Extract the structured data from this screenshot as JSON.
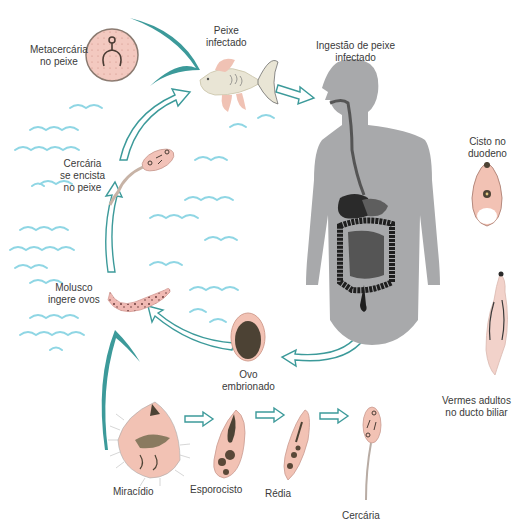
{
  "diagram": {
    "type": "life-cycle",
    "colors": {
      "arrow_teal": "#3c9a9a",
      "water_waves": "#8fd6e4",
      "organism_pink": "#f2c7bd",
      "organism_outline": "#b99a8f",
      "organ_dark": "#2a2a2a",
      "body_gray": "#a8a9ab",
      "egg_brown": "#4c4234"
    },
    "labels": {
      "metacercaria": [
        "Metacercária",
        "no peixe"
      ],
      "infected_fish": [
        "Peixe",
        "infectado"
      ],
      "ingestion": [
        "Ingestão de peixe",
        "infectado"
      ],
      "cyst_duodenum": [
        "Cisto no",
        "duodeno"
      ],
      "cercaria_encysts": [
        "Cercária",
        "se encista",
        "no peixe"
      ],
      "mollusk_eggs": [
        "Molusco",
        "ingere ovos"
      ],
      "embryonated_egg": [
        "Ovo",
        "embrionado"
      ],
      "adult_worms": [
        "Vermes adultos",
        "no ducto biliar"
      ],
      "miracidium": "Miracídio",
      "sporocyst": "Esporocisto",
      "redia": "Rédia",
      "cercaria": "Cercária"
    },
    "stages": [
      {
        "id": "miracidium",
        "label": "Miracídio"
      },
      {
        "id": "sporocyst",
        "label": "Esporocisto"
      },
      {
        "id": "redia",
        "label": "Rédia"
      },
      {
        "id": "cercaria",
        "label": "Cercária"
      }
    ],
    "cycle_order": [
      "Ovo embrionado",
      "Molusco ingere ovos",
      "Cercária se encista no peixe",
      "Peixe infectado",
      "Ingestão de peixe infectado",
      "Cisto no duodeno",
      "Vermes adultos no ducto biliar"
    ]
  }
}
